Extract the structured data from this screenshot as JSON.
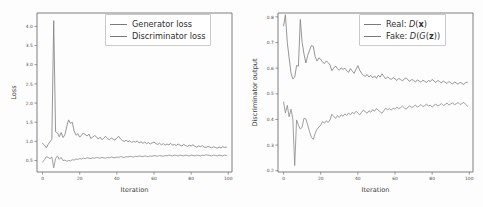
{
  "figure": {
    "background": "#fdfdfd",
    "axis_color": "#6f6f6f",
    "text_color": "#3c3c3c"
  },
  "chart_data": [
    {
      "id": "generator-discriminator-loss",
      "type": "line",
      "title": "",
      "xlabel": "Iteration",
      "ylabel": "Loss",
      "xlim": [
        -3,
        102
      ],
      "ylim": [
        0.2,
        4.35
      ],
      "xticks": [
        0,
        20,
        40,
        60,
        80,
        100
      ],
      "xticklabels": [
        "0",
        "20",
        "40",
        "60",
        "80",
        "100"
      ],
      "yticks": [
        0.5,
        1.0,
        1.5,
        2.0,
        2.5,
        3.0,
        3.5,
        4.0
      ],
      "yticklabels": [
        "0.5",
        "1.0",
        "1.5",
        "2.0",
        "2.5",
        "3.0",
        "3.5",
        "4.0"
      ],
      "grid": false,
      "legend_position": "upper right",
      "line_color": "#7a7a7a",
      "series": [
        {
          "name": "Generator loss",
          "color": "#838383",
          "x": [
            0,
            1,
            2,
            3,
            4,
            5,
            6,
            7,
            8,
            9,
            10,
            11,
            12,
            13,
            14,
            15,
            16,
            17,
            18,
            19,
            20,
            21,
            22,
            23,
            24,
            25,
            26,
            27,
            28,
            29,
            30,
            31,
            32,
            33,
            34,
            35,
            36,
            37,
            38,
            39,
            40,
            41,
            42,
            43,
            44,
            45,
            46,
            47,
            48,
            49,
            50,
            51,
            52,
            53,
            54,
            55,
            56,
            57,
            58,
            59,
            60,
            61,
            62,
            63,
            64,
            65,
            66,
            67,
            68,
            69,
            70,
            71,
            72,
            73,
            74,
            75,
            76,
            77,
            78,
            79,
            80,
            81,
            82,
            83,
            84,
            85,
            86,
            87,
            88,
            89,
            90,
            91,
            92,
            93,
            94,
            95,
            96,
            97,
            98,
            99
          ],
          "values": [
            0.95,
            0.9,
            0.83,
            0.92,
            0.99,
            1.05,
            4.15,
            1.25,
            1.22,
            1.12,
            1.23,
            1.1,
            1.17,
            1.38,
            1.56,
            1.47,
            1.5,
            1.27,
            1.16,
            1.2,
            1.11,
            1.16,
            1.22,
            1.17,
            1.14,
            1.19,
            1.07,
            1.11,
            1.15,
            1.12,
            1.06,
            1.11,
            1.04,
            1.09,
            1.13,
            1.07,
            1.04,
            1.09,
            1.06,
            1.03,
            1.09,
            1.13,
            1.06,
            1.02,
            1.0,
            1.03,
            0.99,
            1.02,
            0.97,
            1.0,
            0.98,
            1.01,
            0.96,
            0.99,
            0.95,
            0.98,
            0.94,
            0.97,
            0.93,
            0.96,
            0.98,
            0.94,
            0.92,
            0.95,
            0.91,
            0.94,
            0.9,
            0.93,
            0.91,
            0.95,
            0.9,
            0.92,
            0.89,
            0.93,
            0.9,
            0.88,
            0.92,
            0.89,
            0.87,
            0.9,
            0.88,
            0.91,
            0.87,
            0.85,
            0.88,
            0.86,
            0.89,
            0.85,
            0.84,
            0.87,
            0.85,
            0.83,
            0.86,
            0.84,
            0.82,
            0.85,
            0.83,
            0.86,
            0.84,
            0.85
          ]
        },
        {
          "name": "Discriminator loss",
          "color": "#8f8f8f",
          "x": [
            0,
            1,
            2,
            3,
            4,
            5,
            6,
            7,
            8,
            9,
            10,
            11,
            12,
            13,
            14,
            15,
            16,
            17,
            18,
            19,
            20,
            21,
            22,
            23,
            24,
            25,
            26,
            27,
            28,
            29,
            30,
            31,
            32,
            33,
            34,
            35,
            36,
            37,
            38,
            39,
            40,
            41,
            42,
            43,
            44,
            45,
            46,
            47,
            48,
            49,
            50,
            51,
            52,
            53,
            54,
            55,
            56,
            57,
            58,
            59,
            60,
            61,
            62,
            63,
            64,
            65,
            66,
            67,
            68,
            69,
            70,
            71,
            72,
            73,
            74,
            75,
            76,
            77,
            78,
            79,
            80,
            81,
            82,
            83,
            84,
            85,
            86,
            87,
            88,
            89,
            90,
            91,
            92,
            93,
            94,
            95,
            96,
            97,
            98,
            99
          ],
          "values": [
            0.46,
            0.52,
            0.6,
            0.58,
            0.55,
            0.59,
            0.31,
            0.55,
            0.62,
            0.53,
            0.58,
            0.5,
            0.51,
            0.48,
            0.5,
            0.49,
            0.52,
            0.51,
            0.54,
            0.53,
            0.55,
            0.54,
            0.56,
            0.55,
            0.57,
            0.56,
            0.55,
            0.57,
            0.56,
            0.58,
            0.57,
            0.56,
            0.58,
            0.57,
            0.56,
            0.58,
            0.57,
            0.59,
            0.58,
            0.57,
            0.59,
            0.58,
            0.6,
            0.59,
            0.58,
            0.6,
            0.59,
            0.61,
            0.6,
            0.59,
            0.61,
            0.6,
            0.62,
            0.61,
            0.6,
            0.62,
            0.61,
            0.6,
            0.62,
            0.61,
            0.63,
            0.62,
            0.61,
            0.63,
            0.62,
            0.61,
            0.63,
            0.62,
            0.64,
            0.63,
            0.62,
            0.64,
            0.63,
            0.62,
            0.64,
            0.63,
            0.62,
            0.64,
            0.63,
            0.62,
            0.64,
            0.63,
            0.62,
            0.64,
            0.63,
            0.62,
            0.64,
            0.63,
            0.65,
            0.64,
            0.63,
            0.62,
            0.64,
            0.63,
            0.62,
            0.64,
            0.63,
            0.62,
            0.64,
            0.63
          ]
        }
      ]
    },
    {
      "id": "discriminator-output",
      "type": "line",
      "title": "",
      "xlabel": "Iteration",
      "ylabel": "Discriminator output",
      "xlim": [
        -3,
        102
      ],
      "ylim": [
        0.195,
        0.815
      ],
      "xticks": [
        0,
        20,
        40,
        60,
        80,
        100
      ],
      "xticklabels": [
        "0",
        "20",
        "40",
        "60",
        "80",
        "100"
      ],
      "yticks": [
        0.2,
        0.3,
        0.4,
        0.5,
        0.6,
        0.7,
        0.8
      ],
      "yticklabels": [
        "0.2",
        "0.3",
        "0.4",
        "0.5",
        "0.6",
        "0.7",
        "0.8"
      ],
      "grid": false,
      "legend_position": "upper right",
      "line_color": "#7a7a7a",
      "series": [
        {
          "name": "Real: D(x)",
          "color": "#838383",
          "x": [
            0,
            1,
            2,
            3,
            4,
            5,
            6,
            7,
            8,
            9,
            10,
            11,
            12,
            13,
            14,
            15,
            16,
            17,
            18,
            19,
            20,
            21,
            22,
            23,
            24,
            25,
            26,
            27,
            28,
            29,
            30,
            31,
            32,
            33,
            34,
            35,
            36,
            37,
            38,
            39,
            40,
            41,
            42,
            43,
            44,
            45,
            46,
            47,
            48,
            49,
            50,
            51,
            52,
            53,
            54,
            55,
            56,
            57,
            58,
            59,
            60,
            61,
            62,
            63,
            64,
            65,
            66,
            67,
            68,
            69,
            70,
            71,
            72,
            73,
            74,
            75,
            76,
            77,
            78,
            79,
            80,
            81,
            82,
            83,
            84,
            85,
            86,
            87,
            88,
            89,
            90,
            91,
            92,
            93,
            94,
            95,
            96,
            97,
            98,
            99
          ],
          "values": [
            0.765,
            0.808,
            0.7,
            0.64,
            0.58,
            0.558,
            0.565,
            0.61,
            0.608,
            0.79,
            0.7,
            0.655,
            0.62,
            0.65,
            0.67,
            0.688,
            0.685,
            0.645,
            0.628,
            0.64,
            0.635,
            0.623,
            0.618,
            0.628,
            0.622,
            0.612,
            0.59,
            0.6,
            0.608,
            0.598,
            0.592,
            0.601,
            0.595,
            0.6,
            0.59,
            0.584,
            0.598,
            0.588,
            0.58,
            0.596,
            0.61,
            0.592,
            0.58,
            0.572,
            0.568,
            0.575,
            0.565,
            0.572,
            0.562,
            0.57,
            0.56,
            0.572,
            0.565,
            0.578,
            0.568,
            0.558,
            0.566,
            0.56,
            0.556,
            0.563,
            0.558,
            0.552,
            0.56,
            0.556,
            0.55,
            0.558,
            0.562,
            0.554,
            0.548,
            0.556,
            0.552,
            0.546,
            0.554,
            0.55,
            0.545,
            0.553,
            0.549,
            0.544,
            0.552,
            0.548,
            0.556,
            0.55,
            0.544,
            0.552,
            0.548,
            0.542,
            0.55,
            0.545,
            0.54,
            0.548,
            0.543,
            0.538,
            0.546,
            0.542,
            0.537,
            0.545,
            0.541,
            0.536,
            0.544,
            0.545
          ]
        },
        {
          "name": "Fake: D(G(z))",
          "color": "#8f8f8f",
          "x": [
            0,
            1,
            2,
            3,
            4,
            5,
            6,
            7,
            8,
            9,
            10,
            11,
            12,
            13,
            14,
            15,
            16,
            17,
            18,
            19,
            20,
            21,
            22,
            23,
            24,
            25,
            26,
            27,
            28,
            29,
            30,
            31,
            32,
            33,
            34,
            35,
            36,
            37,
            38,
            39,
            40,
            41,
            42,
            43,
            44,
            45,
            46,
            47,
            48,
            49,
            50,
            51,
            52,
            53,
            54,
            55,
            56,
            57,
            58,
            59,
            60,
            61,
            62,
            63,
            64,
            65,
            66,
            67,
            68,
            69,
            70,
            71,
            72,
            73,
            74,
            75,
            76,
            77,
            78,
            79,
            80,
            81,
            82,
            83,
            84,
            85,
            86,
            87,
            88,
            89,
            90,
            91,
            92,
            93,
            94,
            95,
            96,
            97,
            98,
            99
          ],
          "values": [
            0.468,
            0.425,
            0.455,
            0.41,
            0.44,
            0.4,
            0.22,
            0.398,
            0.378,
            0.362,
            0.37,
            0.405,
            0.402,
            0.378,
            0.352,
            0.33,
            0.322,
            0.345,
            0.362,
            0.37,
            0.378,
            0.392,
            0.385,
            0.395,
            0.388,
            0.398,
            0.42,
            0.412,
            0.404,
            0.415,
            0.408,
            0.418,
            0.412,
            0.422,
            0.415,
            0.425,
            0.418,
            0.428,
            0.422,
            0.432,
            0.425,
            0.418,
            0.428,
            0.436,
            0.43,
            0.424,
            0.434,
            0.428,
            0.438,
            0.432,
            0.442,
            0.436,
            0.43,
            0.424,
            0.434,
            0.444,
            0.438,
            0.442,
            0.436,
            0.444,
            0.44,
            0.448,
            0.442,
            0.446,
            0.452,
            0.445,
            0.44,
            0.448,
            0.454,
            0.446,
            0.45,
            0.456,
            0.448,
            0.452,
            0.458,
            0.45,
            0.454,
            0.46,
            0.452,
            0.456,
            0.448,
            0.455,
            0.46,
            0.452,
            0.456,
            0.462,
            0.454,
            0.458,
            0.464,
            0.456,
            0.46,
            0.465,
            0.457,
            0.461,
            0.466,
            0.458,
            0.462,
            0.467,
            0.459,
            0.452
          ]
        }
      ]
    }
  ],
  "left_panel": {
    "legend": {
      "entries": [
        {
          "label": "Generator loss"
        },
        {
          "label": "Discriminator loss"
        }
      ]
    }
  },
  "right_panel": {
    "legend": {
      "entries": [
        {
          "label_prefix": "Real:",
          "fn": "D",
          "open": "(",
          "arg": "x",
          "close": ")"
        },
        {
          "label_prefix": "Fake:",
          "fn": "D",
          "open": "(",
          "fn2": "G",
          "open2": "(",
          "arg": "z",
          "close2": ")",
          "close": ")"
        }
      ]
    }
  }
}
